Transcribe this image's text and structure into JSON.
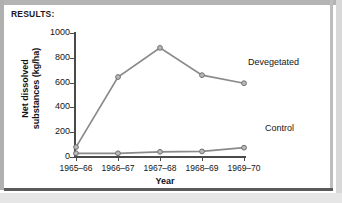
{
  "figure": {
    "results_heading": "RESULTS:"
  },
  "chart_data": {
    "type": "line",
    "title": "RESULTS:",
    "xlabel": "Year",
    "ylabel": "Net dissolved substances (kg/ha)",
    "ylabel_line1": "Net dissolved",
    "ylabel_line2": "substances (kg/ha)",
    "categories": [
      "1965–66",
      "1966–67",
      "1967–68",
      "1968–69",
      "1969–70"
    ],
    "yticks": [
      0,
      200,
      400,
      600,
      800,
      1000
    ],
    "ytick_labels": [
      "0",
      "200",
      "400",
      "600",
      "800",
      "1000"
    ],
    "ylim": [
      0,
      1000
    ],
    "grid": false,
    "legend_position": "inline-right",
    "series": [
      {
        "name": "Devegetated",
        "values": [
          80,
          645,
          880,
          660,
          595
        ],
        "color": "#8a8a8a",
        "marker": "circle"
      },
      {
        "name": "Control",
        "values": [
          30,
          30,
          42,
          45,
          75
        ],
        "color": "#8a8a8a",
        "marker": "circle"
      }
    ],
    "annotations": [
      {
        "text": "Devegetated",
        "x": 248,
        "y": 57
      },
      {
        "text": "Control",
        "x": 265,
        "y": 123
      }
    ]
  }
}
